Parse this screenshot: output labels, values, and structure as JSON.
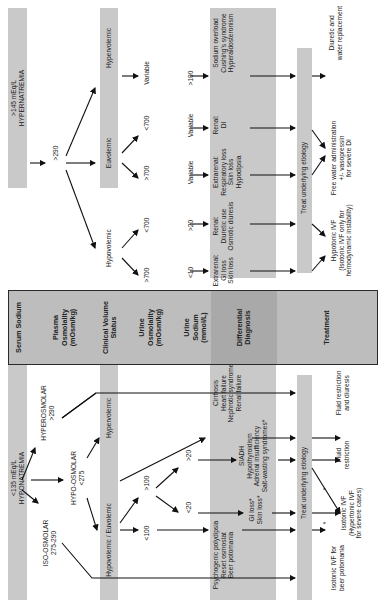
{
  "header": {
    "serum_sodium": "Serum Sodium",
    "plasma_osmolality": "Plasma Osmolality (mOsm/kg)",
    "clinical_volume_status": "Clinical Volume Status",
    "urine_osmolality": "Urine Osmolality (mOsm/kg)",
    "urine_sodium": "Urine Sodium (mmol/L)",
    "differential_diagnosis": "Differential Diagnosis",
    "treatment": "Treatment"
  },
  "hyponatremia": {
    "serum": "<135 mEq/L",
    "serum_label": "HYPONATREMIA",
    "osmolality": {
      "hyper": {
        "label": "HYPEROSMOLAR",
        "value": ">290"
      },
      "hypo": {
        "label": "HYPO-OSMOLAR",
        "value": "<275"
      },
      "iso": {
        "label": "ISO-OSMOLAR",
        "value": "275-290"
      }
    },
    "volume": {
      "hypervolemic": "Hypervolemic",
      "hypo_euvolemic": "Hypovolemic / Euvolemic"
    },
    "urine_osm": {
      "gt100": ">100",
      "lt100": "<100"
    },
    "urine_na": {
      "gt20": ">20",
      "lt20": "<20"
    },
    "diagnosis": {
      "hypervolemic": [
        "Cirrhosis",
        "Heart failure",
        "Nephrotic syndrome",
        "Renal failure"
      ],
      "gt20": [
        "SIADH",
        "Hypothyroidism",
        "Adrenal insufficiency",
        "Salt-wasting syndromes*"
      ],
      "lt20": [
        "GI loss*",
        "Skin loss*"
      ],
      "lt100": [
        "Psychogenic polydipsia",
        "Reset osmostat",
        "Beer potomania"
      ]
    },
    "treat_bar": "Treat underlying etiology",
    "treatment": {
      "hypervolemic": [
        "Fluid restriction",
        "and diuresis"
      ],
      "siadh": [
        "Fluid",
        "restriction"
      ],
      "isotonic": [
        "Isotonic IVF",
        "(Hypertonic IVF",
        "for severe cases)"
      ],
      "beer": [
        "Isotonic IVF for",
        "beer potomania"
      ],
      "star": "*"
    }
  },
  "hypernatremia": {
    "serum": ">145 mEq/L",
    "serum_label": "HYPERNATREMIA",
    "osmolality": ">290",
    "volume": {
      "hypervolemic": "Hypervolemic",
      "euvolemic": "Euvolemic",
      "hypovolemic": "Hypovolemic"
    },
    "urine_osm": {
      "hyper_variable": "Variable",
      "eu_lt700": "<700",
      "eu_gt700": ">700",
      "hypo_lt700": "<700",
      "hypo_gt700": ">700"
    },
    "urine_na": {
      "gt100": ">100",
      "variable_renal": "Variable",
      "variable_extrarenal": "Variable",
      "gt20": ">20",
      "lt10": "<10"
    },
    "diagnosis": {
      "hypervolemic": [
        "Sodium overload",
        "Cushing's syndrome",
        "Hyperaldosteronism"
      ],
      "renal_eu": [
        "Renal:",
        "DI"
      ],
      "extrarenal_eu": [
        "Extrarenal:",
        "Respiratory loss",
        "Skin loss",
        "Hypodipsia"
      ],
      "renal_hypo": [
        "Renal:",
        "Diuretic use",
        "Osmotic diuresis"
      ],
      "extrarenal_hypo": [
        "Extrarenal:",
        "GI loss",
        "Skin loss"
      ]
    },
    "treat_bar": "Treat underlying etiology",
    "treatment": {
      "hypervolemic": [
        "Diuretic and",
        "water replacement"
      ],
      "free_water": [
        "Free water administration",
        "+/- vasopressin",
        "for severe DI"
      ],
      "hypotonic": [
        "Hypotonic IVF",
        "(Isotonic IVF only for",
        "hemodynamic instability)"
      ]
    }
  },
  "colors": {
    "band": "#c9c9c9",
    "header": "#bdbdbd",
    "header_dx": "#a9a9a9",
    "border": "#2a2a2a",
    "text": "#222222"
  }
}
